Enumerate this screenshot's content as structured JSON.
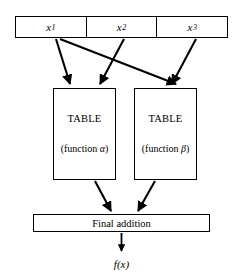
{
  "figure": {
    "kind": "block-flow-diagram",
    "background_color": "#ffffff",
    "line_color": "#000000"
  },
  "input_register": {
    "name": "input-register",
    "cells": [
      {
        "label": "x",
        "subscript": "1",
        "full": "x1"
      },
      {
        "label": "x",
        "subscript": "2",
        "full": "x2"
      },
      {
        "label": "x",
        "subscript": "3",
        "full": "x3"
      }
    ]
  },
  "tables": [
    {
      "id": "alpha",
      "title": "TABLE",
      "subtitle_prefix": "(function ",
      "subtitle_symbol": "α",
      "subtitle_suffix": ")",
      "subtitle": "(function α)"
    },
    {
      "id": "beta",
      "title": "TABLE",
      "subtitle_prefix": "(function ",
      "subtitle_symbol": "β",
      "subtitle_suffix": ")",
      "subtitle": "(function β)"
    }
  ],
  "adder": {
    "label": "Final addition"
  },
  "output": {
    "label": "f(x)"
  },
  "connections": [
    {
      "from": "x1",
      "to": "table-alpha"
    },
    {
      "from": "x1",
      "to": "table-beta"
    },
    {
      "from": "x2",
      "to": "table-alpha"
    },
    {
      "from": "x3",
      "to": "table-beta"
    },
    {
      "from": "table-alpha",
      "to": "final-addition"
    },
    {
      "from": "table-beta",
      "to": "final-addition"
    },
    {
      "from": "final-addition",
      "to": "output"
    }
  ]
}
